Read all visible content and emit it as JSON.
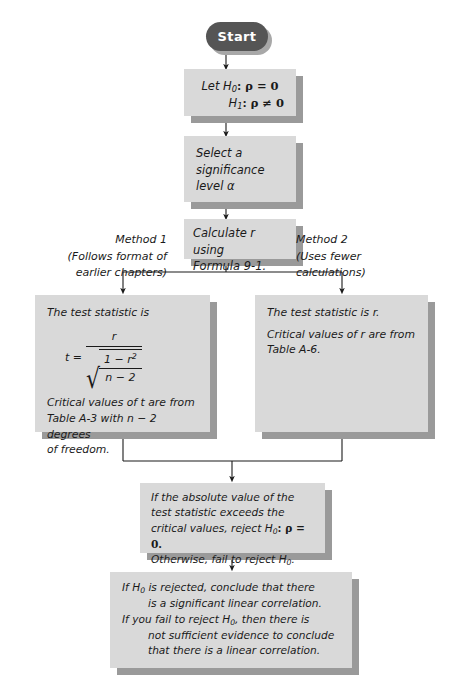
{
  "diagram": {
    "colors": {
      "box_fill": "#d9d9d9",
      "box_shadow": "#9a9a9a",
      "start_fill": "#555555",
      "text": "#1a1a1a",
      "connector": "#1a1a1a"
    }
  },
  "start": {
    "label": "Start"
  },
  "hypotheses_box": {
    "line1_prefix": "Let ",
    "line1_h": "H",
    "line1_sub": "0",
    "line1_rest": ": ρ = 0",
    "line2_h": "H",
    "line2_sub": "1",
    "line2_rest": ": ρ ≠ 0"
  },
  "significance_box": {
    "line1": "Select a",
    "line2": "significance",
    "line3": "level α"
  },
  "calculate_box": {
    "line1": "Calculate r using",
    "line2": "Formula 9-1."
  },
  "method1_label": {
    "line1": "Method 1",
    "line2": "(Follows format of",
    "line3": "earlier chapters)"
  },
  "method2_label": {
    "line1": "Method 2",
    "line2": "(Uses fewer",
    "line3": "calculations)"
  },
  "method1_box": {
    "heading": "The test statistic is",
    "formula": {
      "lhs": "t =",
      "numerator": "r",
      "denominator_numerator": "1 − r",
      "denominator_numerator_sup": "2",
      "denominator_denominator": "n − 2",
      "radical": "√"
    },
    "line1": "Critical values of t are from",
    "line2": "Table A-3 with n − 2 degrees",
    "line3": "of freedom."
  },
  "method2_box": {
    "heading": "The test statistic is r.",
    "line1": "Critical values of r are from",
    "line2": "Table A-6."
  },
  "decision_box": {
    "line1": "If the absolute value of the",
    "line2": "test statistic exceeds the",
    "line3_a": "critical values, reject ",
    "line3_h": "H",
    "line3_sub": "0",
    "line3_b": ": ρ = 0.",
    "line4_a": "Otherwise, fail to reject ",
    "line4_h": "H",
    "line4_sub": "0",
    "line4_b": "."
  },
  "conclusion_box": {
    "line1_a": "If ",
    "line1_h": "H",
    "line1_sub": "0",
    "line1_b": " is rejected, conclude that there",
    "line2": "is a significant linear correlation.",
    "line3_a": "If you fail to reject ",
    "line3_h": "H",
    "line3_sub": "0",
    "line3_b": ", then there is",
    "line4": "not sufficient evidence to conclude",
    "line5": "that there is a linear correlation."
  }
}
